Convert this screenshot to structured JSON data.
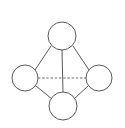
{
  "diagram": {
    "background_color": "#ffffff",
    "node_fill_color": "#ffffff",
    "node_stroke_color": "#5a5a5a",
    "edge_color": "#5a5a5a",
    "dashed_edge_color": "#6e6e6e",
    "nodes": [
      {
        "id": "top",
        "label": "",
        "cx": 62,
        "cy": 36,
        "r": 14
      },
      {
        "id": "left",
        "label": "",
        "cx": 25,
        "cy": 78,
        "r": 13
      },
      {
        "id": "right",
        "label": "",
        "cx": 99,
        "cy": 78,
        "r": 13
      },
      {
        "id": "bottom",
        "label": "",
        "cx": 63,
        "cy": 106,
        "r": 14
      }
    ],
    "edges": [
      {
        "id": "top-left",
        "from": "top",
        "to": "left",
        "style": "solid",
        "x1": 51,
        "y1": 46,
        "x2": 35,
        "y2": 70
      },
      {
        "id": "top-right",
        "from": "top",
        "to": "right",
        "style": "solid",
        "x1": 73,
        "y1": 46,
        "x2": 89,
        "y2": 70
      },
      {
        "id": "top-bottom",
        "from": "top",
        "to": "bottom",
        "style": "solid",
        "x1": 62,
        "y1": 50,
        "x2": 63,
        "y2": 92
      },
      {
        "id": "left-bottom",
        "from": "left",
        "to": "bottom",
        "style": "solid",
        "x1": 36,
        "y1": 86,
        "x2": 52,
        "y2": 99
      },
      {
        "id": "right-bottom",
        "from": "right",
        "to": "bottom",
        "style": "solid",
        "x1": 88,
        "y1": 86,
        "x2": 74,
        "y2": 99
      },
      {
        "id": "left-right",
        "from": "left",
        "to": "right",
        "style": "dashed",
        "x1": 38,
        "y1": 78,
        "x2": 86,
        "y2": 78
      }
    ]
  }
}
